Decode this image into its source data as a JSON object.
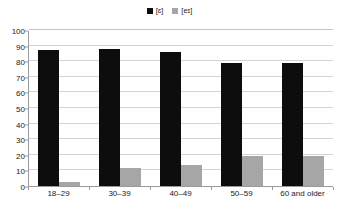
{
  "chart_data": {
    "type": "bar",
    "title": "",
    "xlabel": "",
    "ylabel": "",
    "ylim": [
      0,
      100
    ],
    "ytick_step": 10,
    "yticks": [
      100,
      90,
      80,
      70,
      60,
      50,
      40,
      30,
      20,
      10,
      0
    ],
    "grid": true,
    "legend_position": "top-center",
    "categories": [
      "18–29",
      "30–39",
      "40–49",
      "50–59",
      "60 and older"
    ],
    "series": [
      {
        "name": "[ɛ]",
        "color": "#0d0d0d",
        "values": [
          87,
          88,
          86,
          79,
          79
        ]
      },
      {
        "name": "[eɪ]",
        "color": "#a6a6a6",
        "values": [
          2.5,
          11.5,
          13.5,
          19.5,
          19.5
        ]
      }
    ]
  },
  "legend": {
    "entries": [
      {
        "label": "[ɛ]",
        "color": "#0d0d0d"
      },
      {
        "label": "[eɪ]",
        "color": "#a6a6a6"
      }
    ]
  },
  "axis": {
    "y_labels": [
      "100",
      "90",
      "80",
      "70",
      "60",
      "50",
      "40",
      "30",
      "20",
      "10",
      "0"
    ],
    "x_labels": [
      "18–29",
      "30–39",
      "40–49",
      "50–59",
      "60 and older"
    ]
  },
  "colors": {
    "series_primary": "#0d0d0d",
    "series_secondary": "#a6a6a6",
    "gridline": "#d4d4d4",
    "axis_line": "#9a9a9a",
    "background": "#ffffff",
    "text": "#1a1a1a"
  }
}
